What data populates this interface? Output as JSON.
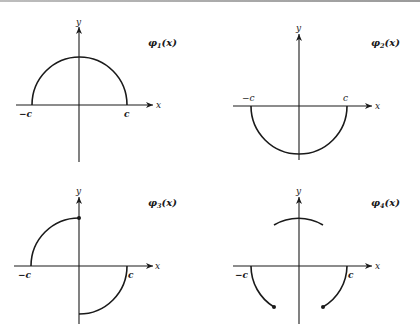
{
  "figure": {
    "panels": [
      {
        "id": "phi1",
        "title": "φ",
        "subscript": "1",
        "arg": "(x)",
        "x_axis_label": "x",
        "y_axis_label": "y",
        "left_tick": "−c",
        "right_tick": "c",
        "description": "Upper semicircle from −c to c"
      },
      {
        "id": "phi2",
        "title": "φ",
        "subscript": "2",
        "arg": "(x)",
        "x_axis_label": "x",
        "y_axis_label": "y",
        "left_tick": "−c",
        "right_tick": "c",
        "description": "Lower semicircle from −c to c"
      },
      {
        "id": "phi3",
        "title": "φ",
        "subscript": "3",
        "arg": "(x)",
        "x_axis_label": "x",
        "y_axis_label": "y",
        "left_tick": "−c",
        "right_tick": "c",
        "description": "Upper quarter circle on [−c,0] with closed dot at top, lower quarter circle on [0,c]"
      },
      {
        "id": "phi4",
        "title": "φ",
        "subscript": "4",
        "arg": "(x)",
        "x_axis_label": "x",
        "y_axis_label": "y",
        "left_tick": "−c",
        "right_tick": "c",
        "description": "Upper arc near x=0, lower arcs near ±c ending in closed dots"
      }
    ]
  }
}
